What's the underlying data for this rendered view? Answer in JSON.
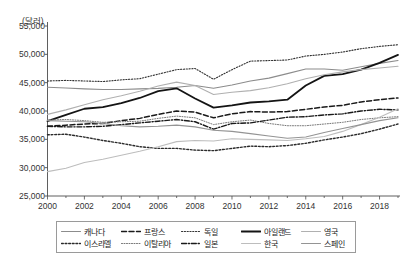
{
  "chart_data": {
    "type": "line",
    "title": "",
    "subtitle": "",
    "unit_label": "(달러)",
    "xlabel": "",
    "ylabel": "",
    "ylim": [
      25000,
      55000
    ],
    "xlim": [
      2000,
      2019
    ],
    "grid": false,
    "legend_position": "bottom",
    "ytick_labels": [
      "55,000",
      "50,000",
      "45,000",
      "40,000",
      "35,000",
      "30,000",
      "25,000"
    ],
    "ytick_values": [
      55000,
      50000,
      45000,
      40000,
      35000,
      30000,
      25000
    ],
    "xtick_labels": [
      "2000",
      "2002",
      "2004",
      "2006",
      "2008",
      "2010",
      "2012",
      "2014",
      "2016",
      "2018"
    ],
    "xtick_values": [
      2000,
      2002,
      2004,
      2006,
      2008,
      2010,
      2012,
      2014,
      2016,
      2018
    ],
    "x": [
      2000,
      2001,
      2002,
      2003,
      2004,
      2005,
      2006,
      2007,
      2008,
      2009,
      2010,
      2011,
      2012,
      2013,
      2014,
      2015,
      2016,
      2017,
      2018,
      2019
    ],
    "series": [
      {
        "name": "캐나다",
        "style": "solid",
        "color": "#8c8c8c",
        "width": 1.1,
        "dash": "",
        "values": [
          44200,
          44050,
          43900,
          43800,
          43800,
          43900,
          44000,
          44200,
          44500,
          44000,
          44600,
          45300,
          45800,
          46600,
          47400,
          47400,
          47200,
          47800,
          48400,
          48900
        ]
      },
      {
        "name": "프랑스",
        "style": "dashed",
        "color": "#1a1a1a",
        "width": 1.5,
        "dash": "5,2.5",
        "values": [
          37300,
          37500,
          37700,
          37800,
          38300,
          38700,
          39400,
          40000,
          39800,
          38800,
          39500,
          39900,
          39800,
          39900,
          40300,
          40700,
          41000,
          41600,
          42000,
          42300
        ]
      },
      {
        "name": "독일",
        "style": "dotted",
        "color": "#333333",
        "width": 1.1,
        "dash": "1.2,1.6",
        "values": [
          45300,
          45400,
          45300,
          45200,
          45500,
          45700,
          46500,
          47300,
          47500,
          45600,
          47300,
          48800,
          48900,
          49000,
          49700,
          50000,
          50400,
          51000,
          51400,
          51700
        ]
      },
      {
        "name": "아일랜드",
        "style": "solid",
        "color": "#141414",
        "width": 1.8,
        "dash": "",
        "values": [
          38200,
          39300,
          40400,
          40700,
          41400,
          42300,
          43500,
          44000,
          42200,
          40600,
          41000,
          41500,
          41700,
          42000,
          44500,
          46200,
          46500,
          47300,
          48500,
          49900
        ]
      },
      {
        "name": "영국",
        "style": "solid",
        "color": "#b0b0b0",
        "width": 1.1,
        "dash": "",
        "values": [
          39400,
          40200,
          41100,
          42000,
          42700,
          43500,
          44400,
          45100,
          44500,
          42900,
          43300,
          43600,
          44100,
          44800,
          45700,
          46400,
          46900,
          47300,
          47600,
          47900
        ]
      },
      {
        "name": "이스라엘",
        "style": "dotted-coarse",
        "color": "#2a2a2a",
        "width": 1.4,
        "dash": "1.8,1.8",
        "values": [
          35800,
          35900,
          35400,
          34800,
          34300,
          33700,
          33400,
          33400,
          33100,
          33000,
          33400,
          33800,
          33700,
          33900,
          34300,
          34900,
          35400,
          36000,
          36800,
          37700
        ]
      },
      {
        "name": "이탈리아",
        "style": "dotted-fine",
        "color": "#777777",
        "width": 1.0,
        "dash": "1,1.5",
        "values": [
          38400,
          38500,
          38300,
          38000,
          38100,
          38200,
          38700,
          39100,
          38800,
          37600,
          38100,
          38400,
          37800,
          37400,
          37400,
          37700,
          38000,
          38500,
          38800,
          39000
        ]
      },
      {
        "name": "일본",
        "style": "dash-dot",
        "color": "#1a1a1a",
        "width": 1.4,
        "dash": "5,1.8,1.2,1.8",
        "values": [
          37300,
          37200,
          37200,
          37300,
          37600,
          37900,
          38200,
          38500,
          38100,
          36800,
          37800,
          37900,
          38400,
          38900,
          39000,
          39300,
          39500,
          40000,
          40300,
          40200
        ]
      },
      {
        "name": "한국",
        "style": "solid",
        "color": "#bdbdbd",
        "width": 1.1,
        "dash": "",
        "values": [
          29300,
          29900,
          30900,
          31500,
          32200,
          32900,
          33700,
          34600,
          34800,
          34700,
          35100,
          35000,
          34900,
          34800,
          35100,
          35500,
          36400,
          37600,
          38900,
          40400
        ]
      },
      {
        "name": "스페인",
        "style": "solid",
        "color": "#949494",
        "width": 1.1,
        "dash": "",
        "values": [
          38300,
          38200,
          38100,
          37800,
          37400,
          37200,
          37300,
          37500,
          37200,
          36600,
          36400,
          36000,
          35600,
          35200,
          35400,
          36200,
          36900,
          37600,
          38300,
          38800
        ]
      }
    ]
  },
  "legend": {
    "rows": [
      [
        {
          "label": "캐나다"
        },
        {
          "label": "프랑스"
        },
        {
          "label": "독일"
        },
        {
          "label": "아일랜드"
        },
        {
          "label": "영국"
        }
      ],
      [
        {
          "label": "이스라엘"
        },
        {
          "label": "이탈리아"
        },
        {
          "label": "일본"
        },
        {
          "label": "한국"
        },
        {
          "label": "스페인"
        }
      ]
    ]
  }
}
